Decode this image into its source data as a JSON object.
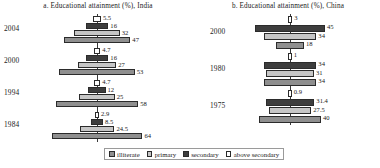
{
  "chart_data": {
    "type": "bar",
    "orientation": "horizontal-centered",
    "grid": false,
    "legend_position": "bottom-center",
    "series_names": [
      "illiterate",
      "primary",
      "secondary",
      "above secondary"
    ],
    "colors": {
      "illiterate": "#8f8f8f",
      "primary": "#c6c6c6",
      "secondary": "#3d3d3d",
      "above_secondary": "#ffffff"
    },
    "xlabel": "",
    "ylabel": "",
    "panels": [
      {
        "id": "india",
        "title": "a. Educational attainment (%), India",
        "categories": [
          "2004",
          "2000",
          "1994",
          "1984"
        ],
        "row_order": [
          "above secondary",
          "secondary",
          "primary",
          "illiterate"
        ],
        "groups": [
          {
            "year": "2004",
            "rows": [
              {
                "name": "above secondary",
                "key": "above",
                "value": 5.5,
                "label": "5.5"
              },
              {
                "name": "secondary",
                "key": "secondary",
                "value": 16,
                "label": "16"
              },
              {
                "name": "primary",
                "key": "primary",
                "value": 32,
                "label": "32"
              },
              {
                "name": "illiterate",
                "key": "illiterate",
                "value": 47,
                "label": "47"
              }
            ]
          },
          {
            "year": "2000",
            "rows": [
              {
                "name": "above secondary",
                "key": "above",
                "value": 4.7,
                "label": "4.7"
              },
              {
                "name": "secondary",
                "key": "secondary",
                "value": 16,
                "label": "16"
              },
              {
                "name": "primary",
                "key": "primary",
                "value": 27,
                "label": "27"
              },
              {
                "name": "illiterate",
                "key": "illiterate",
                "value": 53,
                "label": "53"
              }
            ]
          },
          {
            "year": "1994",
            "rows": [
              {
                "name": "above secondary",
                "key": "above",
                "value": 4.7,
                "label": "4.7"
              },
              {
                "name": "secondary",
                "key": "secondary",
                "value": 12,
                "label": "12"
              },
              {
                "name": "primary",
                "key": "primary",
                "value": 25,
                "label": "25"
              },
              {
                "name": "illiterate",
                "key": "illiterate",
                "value": 58,
                "label": "58"
              }
            ]
          },
          {
            "year": "1984",
            "rows": [
              {
                "name": "above secondary",
                "key": "above",
                "value": 2.9,
                "label": "2.9"
              },
              {
                "name": "secondary",
                "key": "secondary",
                "value": 8.5,
                "label": "8.5"
              },
              {
                "name": "primary",
                "key": "primary",
                "value": 24.5,
                "label": "24.5"
              },
              {
                "name": "illiterate",
                "key": "illiterate",
                "value": 64,
                "label": "64"
              }
            ]
          }
        ]
      },
      {
        "id": "china",
        "title": "b. Educational attainment (%), China",
        "categories": [
          "2000",
          "1980",
          "1975"
        ],
        "row_order": [
          "above secondary",
          "secondary",
          "primary",
          "illiterate"
        ],
        "groups": [
          {
            "year": "2000",
            "rows": [
              {
                "name": "above secondary",
                "key": "above",
                "value": 3,
                "label": "3"
              },
              {
                "name": "secondary",
                "key": "secondary",
                "value": 45,
                "label": "45"
              },
              {
                "name": "primary",
                "key": "primary",
                "value": 34,
                "label": "34"
              },
              {
                "name": "illiterate",
                "key": "illiterate",
                "value": 18,
                "label": "18"
              }
            ]
          },
          {
            "year": "1980",
            "rows": [
              {
                "name": "above secondary",
                "key": "above",
                "value": 1,
                "label": "1"
              },
              {
                "name": "secondary",
                "key": "secondary",
                "value": 34,
                "label": "34"
              },
              {
                "name": "primary",
                "key": "primary",
                "value": 31,
                "label": "31"
              },
              {
                "name": "illiterate",
                "key": "illiterate",
                "value": 34,
                "label": "34"
              }
            ]
          },
          {
            "year": "1975",
            "rows": [
              {
                "name": "above secondary",
                "key": "above",
                "value": 0.9,
                "label": "0.9"
              },
              {
                "name": "secondary",
                "key": "secondary",
                "value": 31.4,
                "label": "31.4"
              },
              {
                "name": "primary",
                "key": "primary",
                "value": 27.5,
                "label": "27.5"
              },
              {
                "name": "illiterate",
                "key": "illiterate",
                "value": 40,
                "label": "40"
              }
            ]
          }
        ]
      }
    ]
  },
  "legend": {
    "items": [
      {
        "label": "illiterate",
        "key": "illiterate"
      },
      {
        "label": "primary",
        "key": "primary"
      },
      {
        "label": "secondary",
        "key": "secondary"
      },
      {
        "label": "above secondary",
        "key": "above"
      }
    ]
  }
}
